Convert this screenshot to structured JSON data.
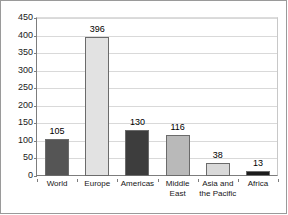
{
  "chart_data": {
    "type": "bar",
    "title": "",
    "subtitle": "",
    "xlabel": "",
    "ylabel": "",
    "ylim": [
      0,
      450
    ],
    "ytick_step": 50,
    "yticks": [
      "450",
      "400",
      "350",
      "300",
      "250",
      "200",
      "150",
      "100",
      "50",
      "0"
    ],
    "grid": true,
    "legend": "none",
    "categories": [
      "World",
      "Europe",
      "Americas",
      "Middle East",
      "Asia and the Pacific",
      "Africa"
    ],
    "values": [
      105,
      396,
      130,
      116,
      38,
      13
    ],
    "data_labels": [
      "105",
      "396",
      "130",
      "116",
      "38",
      "13"
    ],
    "bar_colors": [
      "#555555",
      "#e2e2e2",
      "#3d3d3d",
      "#b9b9b9",
      "#d9d9d9",
      "#1c1c1c"
    ]
  },
  "colors": {
    "frame_border": "#9a9a9a",
    "axis": "#7d7d7d",
    "gridline": "#d9d9d9",
    "bar_outline": "#6b6b6b",
    "text": "#161616",
    "background": "#ffffff"
  }
}
